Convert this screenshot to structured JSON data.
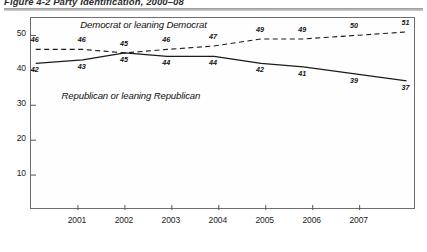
{
  "figure": {
    "title": "Figure 4-2  Party Identification, 2000–08",
    "caption_rule_color": "#9a9a9a"
  },
  "chart_data": {
    "type": "line",
    "title": "Figure 4-2  Party Identification, 2000–08",
    "xlabel": "",
    "ylabel": "",
    "ylim": [
      0,
      55
    ],
    "yticks": [
      10,
      20,
      30,
      40,
      50
    ],
    "ytick_labels": [
      "10",
      "20",
      "30",
      "40",
      "50"
    ],
    "xlim": [
      2000.0,
      2008.2
    ],
    "xticks": [
      2001,
      2002,
      2003,
      2004,
      2005,
      2006,
      2007
    ],
    "xtick_labels": [
      "2001",
      "2002",
      "2003",
      "2004",
      "2005",
      "2006",
      "2007"
    ],
    "grid": false,
    "legend": "inline-annotations",
    "x": [
      2000.1,
      2001.1,
      2002.0,
      2002.9,
      2003.9,
      2004.9,
      2005.8,
      2006.9,
      2008.0
    ],
    "series": [
      {
        "name": "Democrat or leaning Democrat",
        "style": "dashed",
        "color": "#1a1a1a",
        "values": [
          46,
          46,
          45,
          46,
          47,
          49,
          49,
          50,
          51
        ],
        "point_labels": [
          "46",
          "46",
          "45",
          "46",
          "47",
          "49",
          "49",
          "50",
          "51"
        ]
      },
      {
        "name": "Republican or leaning Republican",
        "style": "solid",
        "color": "#1a1a1a",
        "values": [
          42,
          43,
          45,
          44,
          44,
          42,
          41,
          39,
          37
        ],
        "point_labels": [
          "42",
          "43",
          "45",
          "44",
          "44",
          "42",
          "41",
          "39",
          "37"
        ]
      }
    ],
    "annotations": [
      {
        "text": "Democrat or leaning Democrat",
        "x": 2002.35,
        "y": 52.4
      },
      {
        "text": "Republican or leaning Republican",
        "x": 2001.95,
        "y": 32.0
      }
    ]
  }
}
